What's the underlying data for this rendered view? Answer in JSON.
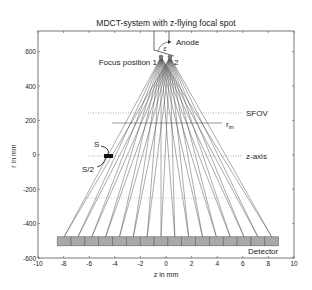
{
  "title": "MDCT-system with z-flying focal spot",
  "xlabel": "z in mm",
  "ylabel": "r in mm",
  "xticks": [
    "-10",
    "-8",
    "-6",
    "-4",
    "-2",
    "0",
    "2",
    "4",
    "6",
    "8",
    "10"
  ],
  "yticks": [
    "600",
    "400",
    "200",
    "0",
    "-200",
    "-400",
    "-600"
  ],
  "labels": {
    "anode": "Anode",
    "epsilon": "ε",
    "focus1": "Focus position 1",
    "focus2": "2",
    "sfov": "SFOV",
    "rim": "r",
    "rim_sub": "im",
    "zaxis": "z-axis",
    "s": "S",
    "s_half": "S/2",
    "detector": "Detector"
  },
  "chart_data": {
    "type": "diagram",
    "title": "MDCT-system with z-flying focal spot",
    "xlabel": "z in mm",
    "ylabel": "r in mm",
    "xlim": [
      -10,
      10
    ],
    "ylim": [
      -600,
      720
    ],
    "focus_positions": [
      {
        "name": "1",
        "z": -0.5,
        "r": 570
      },
      {
        "name": "2",
        "z": 0.5,
        "r": 570
      }
    ],
    "detector": {
      "r": -500,
      "z_start": -8.5,
      "z_end": 8.8,
      "cells": 16
    },
    "sfov_r": 250,
    "rim_r": 190,
    "zaxis_r": 0
  }
}
